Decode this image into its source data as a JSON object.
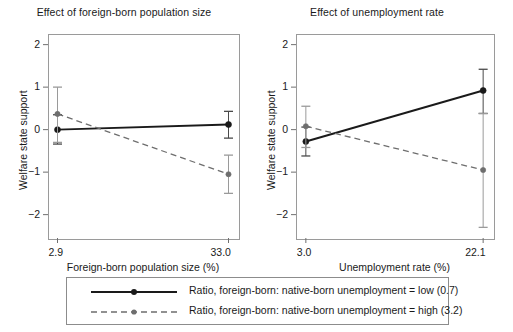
{
  "figure": {
    "y_axis_label": "Welfare state support",
    "y_ticks": [
      "2",
      "1",
      "0",
      "−1",
      "−2"
    ],
    "y_tick_values": [
      2,
      1,
      0,
      -1,
      -2
    ],
    "ylim": [
      -2.55,
      2.25
    ]
  },
  "panels": [
    {
      "id": "panel-left",
      "title": "Effect of foreign-born population size",
      "xlabel": "Foreign-born population size (%)",
      "xticks": [
        "2.9",
        "33.0"
      ]
    },
    {
      "id": "panel-right",
      "title": "Effect of unemployment rate",
      "xlabel": "Unemployment rate (%)",
      "xticks": [
        "3.0",
        "22.1"
      ]
    }
  ],
  "legend": {
    "items": [
      {
        "label": "Ratio, foreign-born: native-born unemployment = low (0.7)",
        "style": "solid",
        "color": "#1a1a1a"
      },
      {
        "label": "Ratio, foreign-born: native-born unemployment = high (3.2)",
        "style": "dashed",
        "color": "#6e6e6e"
      }
    ]
  },
  "chart_data": [
    {
      "type": "line",
      "title": "Effect of foreign-born population size",
      "xlabel": "Foreign-born population size (%)",
      "ylabel": "Welfare state support",
      "x": [
        2.9,
        33.0
      ],
      "xticklabels": [
        "2.9",
        "33.0"
      ],
      "ylim": [
        -2.55,
        2.25
      ],
      "yticks": [
        2,
        1,
        0,
        -1,
        -2
      ],
      "grid": false,
      "legend_position": "below-figure",
      "series": [
        {
          "name": "Ratio, foreign-born: native-born unemployment = low (0.7)",
          "style": "solid",
          "color": "#1a1a1a",
          "values": [
            0.0,
            0.12
          ],
          "error_low": [
            -0.34,
            -0.2
          ],
          "error_high": [
            0.35,
            0.43
          ]
        },
        {
          "name": "Ratio, foreign-born: native-born unemployment = high (3.2)",
          "style": "dashed",
          "color": "#6e6e6e",
          "values": [
            0.37,
            -1.05
          ],
          "error_low": [
            -0.3,
            -1.5
          ],
          "error_high": [
            1.0,
            -0.6
          ]
        }
      ]
    },
    {
      "type": "line",
      "title": "Effect of unemployment rate",
      "xlabel": "Unemployment rate (%)",
      "ylabel": "Welfare state support",
      "x": [
        3.0,
        22.1
      ],
      "xticklabels": [
        "3.0",
        "22.1"
      ],
      "ylim": [
        -2.55,
        2.25
      ],
      "yticks": [
        2,
        1,
        0,
        -1,
        -2
      ],
      "grid": false,
      "legend_position": "below-figure",
      "series": [
        {
          "name": "Ratio, foreign-born: native-born unemployment = low (0.7)",
          "style": "solid",
          "color": "#1a1a1a",
          "values": [
            -0.28,
            0.92
          ],
          "error_low": [
            -0.62,
            0.38
          ],
          "error_high": [
            0.06,
            1.42
          ]
        },
        {
          "name": "Ratio, foreign-born: native-born unemployment = high (3.2)",
          "style": "dashed",
          "color": "#6e6e6e",
          "values": [
            0.08,
            -0.95
          ],
          "error_low": [
            -0.42,
            -2.3
          ],
          "error_high": [
            0.55,
            0.38
          ]
        }
      ]
    }
  ]
}
